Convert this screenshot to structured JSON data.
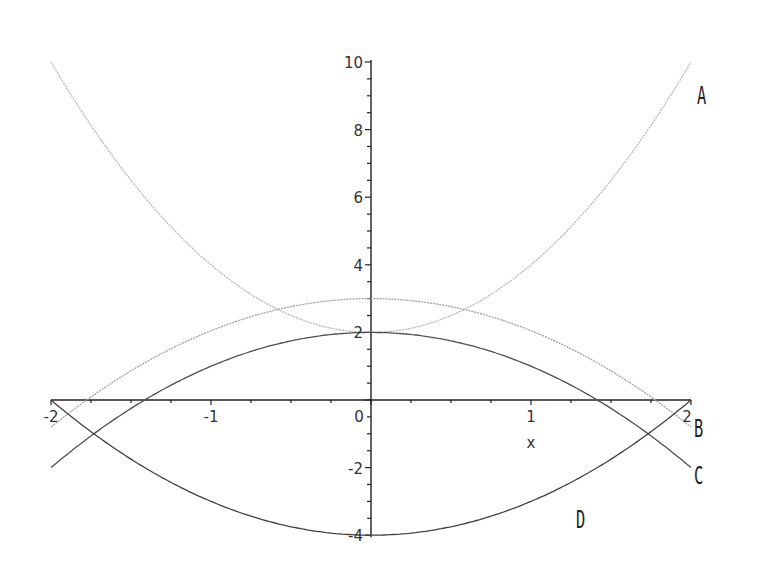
{
  "chart_data": {
    "type": "line",
    "title": "",
    "xlabel": "x",
    "ylabel": "",
    "xlim": [
      -2,
      2
    ],
    "ylim": [
      -4,
      10
    ],
    "grid": false,
    "legend": "inline curve labels at right",
    "x_ticks": [
      "-2",
      "-1",
      "0",
      "1",
      "2"
    ],
    "y_ticks": [
      "-4",
      "-2",
      "0",
      "2",
      "4",
      "6",
      "8",
      "10"
    ],
    "series": [
      {
        "name": "A",
        "formula_estimate": "y = 2x^2 + 2",
        "color": "#b8b8b8",
        "x": [
          -2,
          -1.5,
          -1,
          -0.5,
          0,
          0.5,
          1,
          1.5,
          2
        ],
        "y": [
          10,
          6.5,
          4,
          2.5,
          2,
          2.5,
          4,
          6.5,
          10
        ]
      },
      {
        "name": "B",
        "formula_estimate": "y = 3 - 0.95x^2",
        "color": "#a0a0a0",
        "x": [
          -2,
          -1.5,
          -1,
          -0.5,
          0,
          0.5,
          1,
          1.5,
          2
        ],
        "y": [
          -0.8,
          0.86,
          2.05,
          2.76,
          3,
          2.76,
          2.05,
          0.86,
          -0.8
        ]
      },
      {
        "name": "C",
        "formula_estimate": "y = 2 - x^2",
        "color": "#505050",
        "x": [
          -2,
          -1.5,
          -1,
          -0.5,
          0,
          0.5,
          1,
          1.5,
          2
        ],
        "y": [
          -2,
          -0.25,
          1,
          1.75,
          2,
          1.75,
          1,
          -0.25,
          -2
        ]
      },
      {
        "name": "D",
        "formula_estimate": "y = x^2 - 4",
        "color": "#404040",
        "x": [
          -2,
          -1.5,
          -1,
          -0.5,
          0,
          0.5,
          1,
          1.5,
          2
        ],
        "y": [
          0,
          -1.75,
          -3,
          -3.75,
          -4,
          -3.75,
          -3,
          -1.75,
          0
        ]
      }
    ],
    "annotations": [
      {
        "text": "A",
        "x": 2.1,
        "y": 9.2
      },
      {
        "text": "B",
        "x": 2.1,
        "y": -0.4
      },
      {
        "text": "C",
        "x": 2.1,
        "y": -2.2
      },
      {
        "text": "D",
        "x": 1.4,
        "y": -3.6
      }
    ]
  }
}
